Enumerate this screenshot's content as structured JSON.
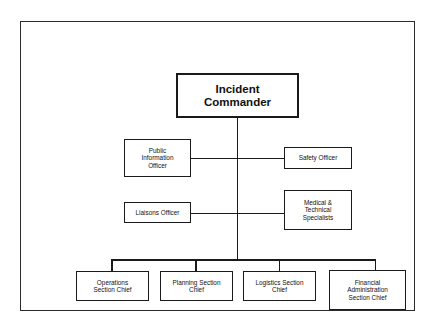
{
  "diagram": {
    "frame": {
      "border_color": "#2b2b2b",
      "background_color": "#ffffff"
    },
    "line_color": "#1a1a1a",
    "text_color": "#111111",
    "nodes": {
      "incident_commander": {
        "label": "Incident\nCommander",
        "level": "command",
        "emphasis": "bold"
      },
      "public_information_officer": {
        "label": "Public\nInformation\nOfficer",
        "level": "command-staff"
      },
      "safety_officer": {
        "label": "Safety Officer",
        "level": "command-staff"
      },
      "liaisons_officer": {
        "label": "Liaisons Officer",
        "level": "command-staff"
      },
      "medical_technical_specialists": {
        "label": "Medical &\nTechnical\nSpecialists",
        "level": "command-staff"
      },
      "operations_section_chief": {
        "label": "Operations\nSection Chief",
        "level": "general-staff"
      },
      "planning_section_chief": {
        "label": "Planning Section\nChief",
        "level": "general-staff"
      },
      "logistics_section_chief": {
        "label": "Logistics Section\nChief",
        "level": "general-staff"
      },
      "financial_administration_section_chief": {
        "label": "Financial\nAdministration\nSection Chief",
        "level": "general-staff"
      }
    },
    "connections": [
      {
        "from": "incident_commander",
        "to": "command-trunk"
      },
      {
        "from": "command-trunk",
        "to": "public_information_officer"
      },
      {
        "from": "command-trunk",
        "to": "safety_officer"
      },
      {
        "from": "command-trunk",
        "to": "liaisons_officer"
      },
      {
        "from": "command-trunk",
        "to": "medical_technical_specialists"
      },
      {
        "from": "command-trunk",
        "to": "operations_section_chief"
      },
      {
        "from": "command-trunk",
        "to": "planning_section_chief"
      },
      {
        "from": "command-trunk",
        "to": "logistics_section_chief"
      },
      {
        "from": "command-trunk",
        "to": "financial_administration_section_chief"
      }
    ]
  }
}
